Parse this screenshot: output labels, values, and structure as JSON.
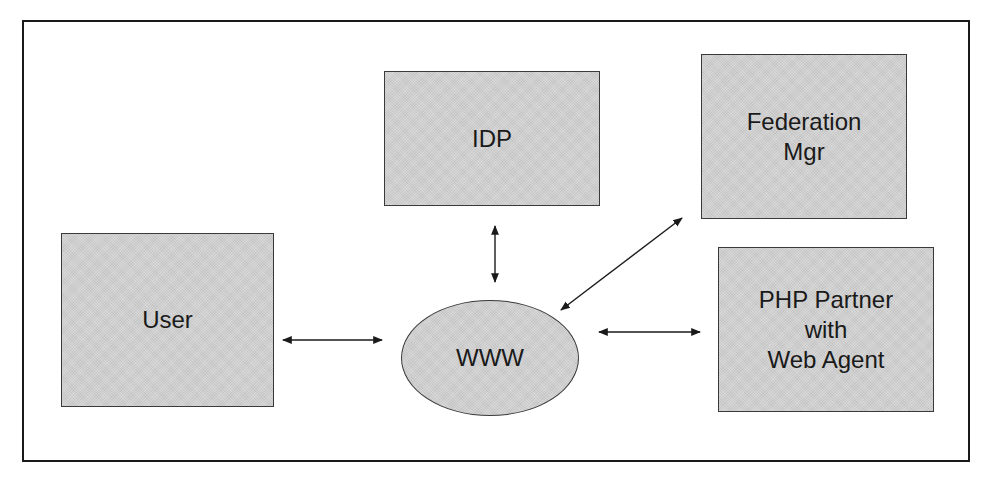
{
  "diagram": {
    "type": "network-architecture",
    "nodes": [
      {
        "id": "idp",
        "label": "IDP",
        "shape": "rectangle"
      },
      {
        "id": "federation_mgr",
        "label": "Federation\nMgr",
        "shape": "rectangle"
      },
      {
        "id": "user",
        "label": "User",
        "shape": "rectangle"
      },
      {
        "id": "www",
        "label": "WWW",
        "shape": "ellipse"
      },
      {
        "id": "php_partner",
        "label": "PHP Partner\nwith\nWeb Agent",
        "shape": "rectangle"
      }
    ],
    "edges": [
      {
        "from": "user",
        "to": "www",
        "direction": "bidirectional"
      },
      {
        "from": "idp",
        "to": "www",
        "direction": "bidirectional"
      },
      {
        "from": "federation_mgr",
        "to": "www",
        "direction": "bidirectional"
      },
      {
        "from": "www",
        "to": "php_partner",
        "direction": "bidirectional"
      }
    ],
    "colors": {
      "node_fill": "#cfcfcf",
      "node_border": "#3a3a3a",
      "frame_border": "#1a1a1a",
      "arrow": "#1a1a1a",
      "text": "#1a1a1a"
    }
  }
}
